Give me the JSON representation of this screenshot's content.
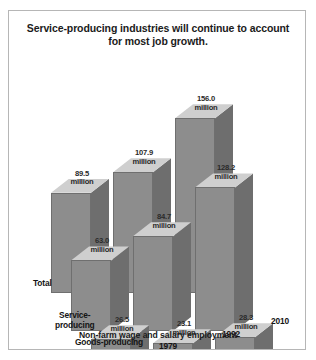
{
  "figure": {
    "title": "Service-producing industries will continue to account for most job growth.",
    "caption": "Non-farm wage and salary employment",
    "unit_suffix": "million"
  },
  "colors": {
    "bar_front": "#8d8d8d",
    "bar_side": "#6e6e6e",
    "bar_top": "#cfcfcf",
    "frame_border": "#b6b6b6",
    "background": "#ffffff",
    "text": "#1b1b1b"
  },
  "labels": {
    "rows": [
      {
        "name": "total",
        "text": "Total"
      },
      {
        "name": "service-producing",
        "text": "Service-\nproducing"
      },
      {
        "name": "goods-producing",
        "text": "Goods-producing"
      }
    ],
    "years": [
      "1979",
      "1992",
      "2010"
    ]
  },
  "chart_data": {
    "type": "bar",
    "title": "Service-producing industries will continue to account for most job growth.",
    "subtitle": "Non-farm wage and salary employment",
    "xlabel": "",
    "ylabel": "Employment (millions)",
    "categories": [
      "1979",
      "1992",
      "2010"
    ],
    "series": [
      {
        "name": "Total",
        "values": [
          89.5,
          107.9,
          156.0
        ]
      },
      {
        "name": "Service-producing",
        "values": [
          63.0,
          84.7,
          128.2
        ]
      },
      {
        "name": "Goods-producing",
        "values": [
          26.5,
          23.1,
          28.3
        ]
      }
    ],
    "value_labels": [
      [
        "89.5 million",
        "107.9 million",
        "156.0 million"
      ],
      [
        "63.0 million",
        "84.7 million",
        "128.2 million"
      ],
      [
        "26.5 million",
        "23.1 million",
        "28.3 million"
      ]
    ],
    "ylim": [
      0,
      160
    ],
    "grid": false,
    "legend": "none",
    "projection": "3d-isometric",
    "depth_axis": [
      "Total",
      "Service-producing",
      "Goods-producing"
    ]
  }
}
